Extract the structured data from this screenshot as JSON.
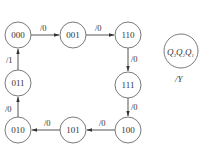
{
  "diagram": {
    "type": "state-transition",
    "states": [
      {
        "id": "s000",
        "label": "000",
        "cx": 18,
        "cy": 35
      },
      {
        "id": "s001",
        "label": "001",
        "cx": 73,
        "cy": 35
      },
      {
        "id": "s110",
        "label": "110",
        "cx": 128,
        "cy": 35
      },
      {
        "id": "s111",
        "label": "111",
        "cx": 128,
        "cy": 85
      },
      {
        "id": "s100",
        "label": "100",
        "cx": 128,
        "cy": 130
      },
      {
        "id": "s101",
        "label": "101",
        "cx": 73,
        "cy": 130
      },
      {
        "id": "s010",
        "label": "010",
        "cx": 18,
        "cy": 130
      },
      {
        "id": "s011",
        "label": "011",
        "cx": 18,
        "cy": 83
      }
    ],
    "transitions": [
      {
        "from": "000",
        "to": "001",
        "label": "/0"
      },
      {
        "from": "001",
        "to": "110",
        "label": "/0"
      },
      {
        "from": "110",
        "to": "111",
        "label": "/0"
      },
      {
        "from": "111",
        "to": "100",
        "label": "/0"
      },
      {
        "from": "100",
        "to": "101",
        "label": "/0"
      },
      {
        "from": "101",
        "to": "010",
        "label": "/0"
      },
      {
        "from": "010",
        "to": "011",
        "label": "/0"
      },
      {
        "from": "011",
        "to": "000",
        "label": "/1"
      }
    ],
    "legend": {
      "state_label": "Q3Q2Q1",
      "vars": [
        {
          "name": "Q",
          "sub": "3"
        },
        {
          "name": "Q",
          "sub": "2"
        },
        {
          "name": "Q",
          "sub": "1"
        }
      ],
      "output_label": "/Y"
    }
  }
}
